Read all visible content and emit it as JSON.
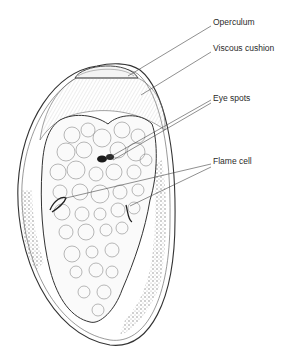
{
  "figure": {
    "labels": [
      {
        "id": "operculum",
        "text": "Operculum",
        "x": 213,
        "y": 22
      },
      {
        "id": "viscous-cushion",
        "text": "Viscous cushion",
        "x": 213,
        "y": 48
      },
      {
        "id": "eye-spots",
        "text": "Eye spots",
        "x": 213,
        "y": 98
      },
      {
        "id": "flame-cell",
        "text": "Flame cell",
        "x": 213,
        "y": 161
      }
    ],
    "colors": {
      "line": "#3a3a3a",
      "stipple": "#6a6a6a",
      "eyespot": "#1a1a1a",
      "background": "#ffffff"
    }
  }
}
